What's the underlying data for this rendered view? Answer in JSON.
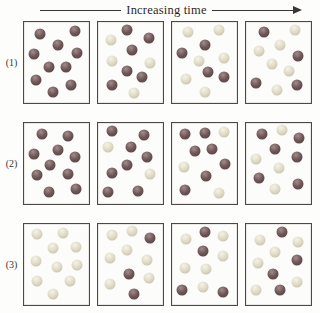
{
  "header": {
    "title": "Increasing time",
    "arrow_direction": "right"
  },
  "sphere_colors": {
    "red": "#6e5656",
    "yellow": "#ddd8c4"
  },
  "summary": {
    "spheres_per_box": 10,
    "red_counts_by_row": [
      [
        10,
        6,
        4,
        4
      ],
      [
        10,
        8,
        7,
        6
      ],
      [
        0,
        3,
        4,
        4
      ]
    ],
    "yellow_counts_by_row": [
      [
        0,
        4,
        6,
        6
      ],
      [
        0,
        2,
        3,
        4
      ],
      [
        10,
        7,
        6,
        6
      ]
    ]
  },
  "rows": [
    {
      "label": "(1)",
      "boxes": [
        {
          "spheres": [
            {
              "x": 25,
              "y": 15,
              "c": "red"
            },
            {
              "x": 78,
              "y": 11,
              "c": "red"
            },
            {
              "x": 52,
              "y": 28,
              "c": "red"
            },
            {
              "x": 15,
              "y": 40,
              "c": "red"
            },
            {
              "x": 82,
              "y": 38,
              "c": "red"
            },
            {
              "x": 38,
              "y": 55,
              "c": "red"
            },
            {
              "x": 65,
              "y": 55,
              "c": "red"
            },
            {
              "x": 18,
              "y": 72,
              "c": "red"
            },
            {
              "x": 72,
              "y": 78,
              "c": "red"
            },
            {
              "x": 45,
              "y": 86,
              "c": "red"
            }
          ]
        },
        {
          "spheres": [
            {
              "x": 45,
              "y": 10,
              "c": "red"
            },
            {
              "x": 20,
              "y": 22,
              "c": "yellow"
            },
            {
              "x": 78,
              "y": 20,
              "c": "red"
            },
            {
              "x": 52,
              "y": 35,
              "c": "red"
            },
            {
              "x": 22,
              "y": 48,
              "c": "yellow"
            },
            {
              "x": 80,
              "y": 50,
              "c": "yellow"
            },
            {
              "x": 45,
              "y": 60,
              "c": "red"
            },
            {
              "x": 68,
              "y": 68,
              "c": "red"
            },
            {
              "x": 22,
              "y": 78,
              "c": "red"
            },
            {
              "x": 55,
              "y": 88,
              "c": "yellow"
            }
          ]
        },
        {
          "spheres": [
            {
              "x": 25,
              "y": 12,
              "c": "yellow"
            },
            {
              "x": 72,
              "y": 10,
              "c": "yellow"
            },
            {
              "x": 50,
              "y": 28,
              "c": "red"
            },
            {
              "x": 15,
              "y": 38,
              "c": "red"
            },
            {
              "x": 42,
              "y": 48,
              "c": "yellow"
            },
            {
              "x": 80,
              "y": 45,
              "c": "yellow"
            },
            {
              "x": 55,
              "y": 62,
              "c": "red"
            },
            {
              "x": 22,
              "y": 70,
              "c": "yellow"
            },
            {
              "x": 80,
              "y": 68,
              "c": "red"
            },
            {
              "x": 50,
              "y": 86,
              "c": "yellow"
            }
          ]
        },
        {
          "spheres": [
            {
              "x": 28,
              "y": 12,
              "c": "red"
            },
            {
              "x": 75,
              "y": 10,
              "c": "yellow"
            },
            {
              "x": 52,
              "y": 28,
              "c": "yellow"
            },
            {
              "x": 20,
              "y": 36,
              "c": "yellow"
            },
            {
              "x": 80,
              "y": 42,
              "c": "red"
            },
            {
              "x": 40,
              "y": 52,
              "c": "yellow"
            },
            {
              "x": 66,
              "y": 60,
              "c": "yellow"
            },
            {
              "x": 15,
              "y": 75,
              "c": "red"
            },
            {
              "x": 48,
              "y": 84,
              "c": "yellow"
            },
            {
              "x": 78,
              "y": 78,
              "c": "red"
            }
          ]
        }
      ]
    },
    {
      "label": "(2)",
      "boxes": [
        {
          "spheres": [
            {
              "x": 28,
              "y": 13,
              "c": "red"
            },
            {
              "x": 68,
              "y": 16,
              "c": "red"
            },
            {
              "x": 52,
              "y": 33,
              "c": "red"
            },
            {
              "x": 15,
              "y": 38,
              "c": "red"
            },
            {
              "x": 78,
              "y": 42,
              "c": "red"
            },
            {
              "x": 40,
              "y": 52,
              "c": "red"
            },
            {
              "x": 20,
              "y": 64,
              "c": "red"
            },
            {
              "x": 68,
              "y": 63,
              "c": "red"
            },
            {
              "x": 38,
              "y": 85,
              "c": "red"
            },
            {
              "x": 80,
              "y": 82,
              "c": "red"
            }
          ]
        },
        {
          "spheres": [
            {
              "x": 22,
              "y": 10,
              "c": "red"
            },
            {
              "x": 70,
              "y": 15,
              "c": "red"
            },
            {
              "x": 15,
              "y": 30,
              "c": "yellow"
            },
            {
              "x": 50,
              "y": 30,
              "c": "red"
            },
            {
              "x": 75,
              "y": 42,
              "c": "red"
            },
            {
              "x": 45,
              "y": 52,
              "c": "red"
            },
            {
              "x": 22,
              "y": 62,
              "c": "red"
            },
            {
              "x": 80,
              "y": 63,
              "c": "yellow"
            },
            {
              "x": 15,
              "y": 85,
              "c": "red"
            },
            {
              "x": 62,
              "y": 84,
              "c": "red"
            }
          ]
        },
        {
          "spheres": [
            {
              "x": 20,
              "y": 14,
              "c": "red"
            },
            {
              "x": 50,
              "y": 12,
              "c": "red"
            },
            {
              "x": 80,
              "y": 11,
              "c": "yellow"
            },
            {
              "x": 35,
              "y": 34,
              "c": "red"
            },
            {
              "x": 62,
              "y": 32,
              "c": "red"
            },
            {
              "x": 18,
              "y": 54,
              "c": "yellow"
            },
            {
              "x": 82,
              "y": 50,
              "c": "red"
            },
            {
              "x": 52,
              "y": 65,
              "c": "red"
            },
            {
              "x": 20,
              "y": 83,
              "c": "red"
            },
            {
              "x": 72,
              "y": 86,
              "c": "yellow"
            }
          ]
        },
        {
          "spheres": [
            {
              "x": 25,
              "y": 13,
              "c": "red"
            },
            {
              "x": 55,
              "y": 9,
              "c": "yellow"
            },
            {
              "x": 82,
              "y": 18,
              "c": "red"
            },
            {
              "x": 45,
              "y": 32,
              "c": "red"
            },
            {
              "x": 15,
              "y": 45,
              "c": "yellow"
            },
            {
              "x": 78,
              "y": 42,
              "c": "red"
            },
            {
              "x": 50,
              "y": 55,
              "c": "yellow"
            },
            {
              "x": 20,
              "y": 68,
              "c": "red"
            },
            {
              "x": 45,
              "y": 81,
              "c": "yellow"
            },
            {
              "x": 80,
              "y": 75,
              "c": "red"
            }
          ]
        }
      ]
    },
    {
      "label": "(3)",
      "boxes": [
        {
          "spheres": [
            {
              "x": 20,
              "y": 12,
              "c": "yellow"
            },
            {
              "x": 60,
              "y": 11,
              "c": "yellow"
            },
            {
              "x": 45,
              "y": 30,
              "c": "yellow"
            },
            {
              "x": 80,
              "y": 28,
              "c": "yellow"
            },
            {
              "x": 18,
              "y": 46,
              "c": "yellow"
            },
            {
              "x": 50,
              "y": 53,
              "c": "yellow"
            },
            {
              "x": 82,
              "y": 50,
              "c": "yellow"
            },
            {
              "x": 20,
              "y": 70,
              "c": "yellow"
            },
            {
              "x": 70,
              "y": 70,
              "c": "yellow"
            },
            {
              "x": 45,
              "y": 87,
              "c": "yellow"
            }
          ]
        },
        {
          "spheres": [
            {
              "x": 22,
              "y": 13,
              "c": "yellow"
            },
            {
              "x": 52,
              "y": 9,
              "c": "yellow"
            },
            {
              "x": 80,
              "y": 17,
              "c": "red"
            },
            {
              "x": 45,
              "y": 32,
              "c": "yellow"
            },
            {
              "x": 18,
              "y": 42,
              "c": "yellow"
            },
            {
              "x": 75,
              "y": 44,
              "c": "yellow"
            },
            {
              "x": 48,
              "y": 62,
              "c": "red"
            },
            {
              "x": 18,
              "y": 74,
              "c": "yellow"
            },
            {
              "x": 78,
              "y": 67,
              "c": "yellow"
            },
            {
              "x": 55,
              "y": 87,
              "c": "red"
            }
          ]
        },
        {
          "spheres": [
            {
              "x": 50,
              "y": 10,
              "c": "red"
            },
            {
              "x": 22,
              "y": 19,
              "c": "yellow"
            },
            {
              "x": 78,
              "y": 15,
              "c": "yellow"
            },
            {
              "x": 48,
              "y": 33,
              "c": "red"
            },
            {
              "x": 78,
              "y": 40,
              "c": "yellow"
            },
            {
              "x": 20,
              "y": 54,
              "c": "yellow"
            },
            {
              "x": 52,
              "y": 55,
              "c": "yellow"
            },
            {
              "x": 15,
              "y": 82,
              "c": "red"
            },
            {
              "x": 48,
              "y": 78,
              "c": "yellow"
            },
            {
              "x": 78,
              "y": 84,
              "c": "red"
            }
          ]
        },
        {
          "spheres": [
            {
              "x": 55,
              "y": 10,
              "c": "red"
            },
            {
              "x": 22,
              "y": 20,
              "c": "yellow"
            },
            {
              "x": 80,
              "y": 22,
              "c": "yellow"
            },
            {
              "x": 45,
              "y": 35,
              "c": "yellow"
            },
            {
              "x": 18,
              "y": 48,
              "c": "yellow"
            },
            {
              "x": 78,
              "y": 45,
              "c": "red"
            },
            {
              "x": 42,
              "y": 62,
              "c": "red"
            },
            {
              "x": 15,
              "y": 82,
              "c": "yellow"
            },
            {
              "x": 52,
              "y": 81,
              "c": "red"
            },
            {
              "x": 78,
              "y": 72,
              "c": "yellow"
            }
          ]
        }
      ]
    }
  ]
}
